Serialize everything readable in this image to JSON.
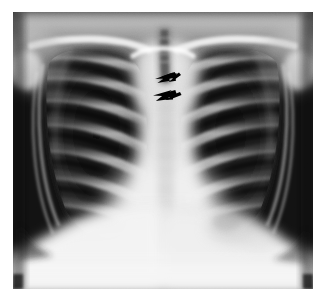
{
  "image": {
    "modality": "chest-radiograph",
    "view": "frontal PA",
    "alt": "Frontal chest radiograph of a child showing the thorax with ribs, clavicles, trachea, mediastinum and diaphragm; two black arrows mark the right paratracheal region.",
    "frame": {
      "x": 13,
      "y": 12,
      "width": 300,
      "height": 277
    },
    "background_color": "#ffffff",
    "film_dark_color": "#0d0d0d",
    "film_light_color": "#f4f4f4"
  },
  "annotations": {
    "arrow_color": "#000000",
    "count": 2,
    "items": [
      {
        "id": "arrow-upper",
        "label": "upper arrow",
        "points_to": "right paratracheal stripe / upper mediastinal border",
        "direction": "left",
        "x": 155,
        "y": 72,
        "width": 22,
        "height": 11
      },
      {
        "id": "arrow-lower",
        "label": "lower arrow",
        "points_to": "right paratracheal stripe / lower mediastinal border",
        "direction": "left",
        "x": 153,
        "y": 90,
        "width": 24,
        "height": 11
      }
    ]
  },
  "anatomy": {
    "regions": [
      {
        "name": "right lung field",
        "side": "viewer-left",
        "appearance": "dark, aerated, ribs superimposed"
      },
      {
        "name": "left lung field",
        "side": "viewer-right",
        "appearance": "dark, aerated, ribs superimposed"
      },
      {
        "name": "mediastinum",
        "side": "center",
        "appearance": "bright vertical band"
      },
      {
        "name": "trachea",
        "side": "center-superior",
        "appearance": "dark air column"
      },
      {
        "name": "clavicles",
        "side": "superior",
        "appearance": "bright oblique bones"
      },
      {
        "name": "diaphragm",
        "side": "inferior",
        "appearance": "bright dome"
      },
      {
        "name": "gastric bubble",
        "side": "inferior-left",
        "appearance": "lucent rounded area"
      },
      {
        "name": "cardiac silhouette",
        "side": "center-inferior",
        "appearance": "bright, widened"
      },
      {
        "name": "scapula",
        "side": "lateral",
        "appearance": "faint oblique edge"
      }
    ],
    "rib_pairs_visible": 9
  },
  "caption": {
    "text": ""
  }
}
